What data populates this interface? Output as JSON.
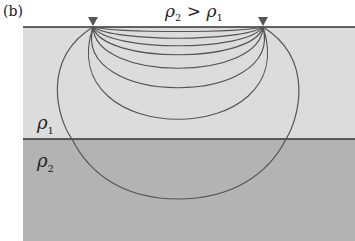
{
  "panel_label": "(b)",
  "relation": {
    "left": "ρ",
    "left_sub": "2",
    "op": " > ",
    "right": "ρ",
    "right_sub": "1"
  },
  "layers": [
    {
      "name": "upper",
      "symbol": "ρ",
      "sub": "1",
      "color": "#dcdcdc",
      "top": 27,
      "bottom": 139
    },
    {
      "name": "lower",
      "symbol": "ρ",
      "sub": "2",
      "color": "#b3b3b3",
      "top": 139,
      "bottom": 241
    }
  ],
  "surface_y": 27,
  "boundary_y": 139,
  "region_left_x": 23,
  "electrodes": [
    {
      "x": 93,
      "label": "electrode-A"
    },
    {
      "x": 263,
      "label": "electrode-B"
    }
  ],
  "current_lines": {
    "description": "current flow lines between two surface electrodes",
    "bottoms_y": [
      35,
      44,
      53,
      63,
      77,
      96,
      129,
      199
    ]
  },
  "colors": {
    "line": "#555555",
    "boundary": "#333333",
    "electrode": "#555555"
  }
}
